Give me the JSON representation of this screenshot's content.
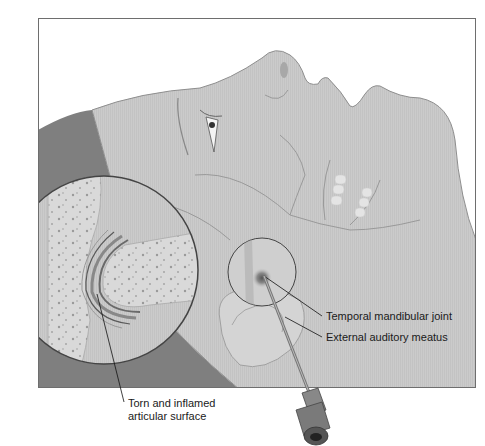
{
  "figure": {
    "labels": {
      "temporal_mandibular_joint": "Temporal mandibular joint",
      "external_auditory_meatus": "External auditory meatus",
      "torn_line1": "Torn and inflamed",
      "torn_line2": "articular surface"
    },
    "colors": {
      "frame_border": "#6e6e6e",
      "skin": "#c9c9c9",
      "hair": "#7d7d7d",
      "bone": "#dcdcdc",
      "background": "#ffffff"
    }
  }
}
